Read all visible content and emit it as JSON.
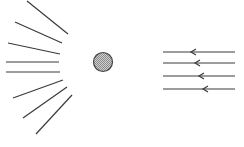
{
  "diagram": {
    "width": 244,
    "height": 147,
    "colors": {
      "line": "#3a3a3a",
      "circle_stroke": "#444444",
      "circle_fill": "#b8b8b8",
      "background": "#ffffff"
    },
    "object": {
      "shape": "circle",
      "cx": 103,
      "cy": 62,
      "r": 9.5,
      "fill_pattern": "stippled-gray"
    },
    "scattered_rays": [
      {
        "x1": 27,
        "y1": 1,
        "x2": 68,
        "y2": 34
      },
      {
        "x1": 15,
        "y1": 22,
        "x2": 62,
        "y2": 43
      },
      {
        "x1": 8,
        "y1": 43,
        "x2": 60,
        "y2": 54
      },
      {
        "x1": 6,
        "y1": 62,
        "x2": 59,
        "y2": 62
      },
      {
        "x1": 6,
        "y1": 72,
        "x2": 60,
        "y2": 72
      },
      {
        "x1": 13,
        "y1": 98,
        "x2": 63,
        "y2": 80
      },
      {
        "x1": 23,
        "y1": 118,
        "x2": 67,
        "y2": 87
      },
      {
        "x1": 36,
        "y1": 134,
        "x2": 72,
        "y2": 95
      }
    ],
    "incident_rays": [
      {
        "x1": 163,
        "x2": 235,
        "y": 52,
        "arrow_x": 191,
        "direction": "left"
      },
      {
        "x1": 163,
        "x2": 235,
        "y": 63,
        "arrow_x": 195,
        "direction": "left"
      },
      {
        "x1": 163,
        "x2": 235,
        "y": 76,
        "arrow_x": 199,
        "direction": "left"
      },
      {
        "x1": 163,
        "x2": 235,
        "y": 89,
        "arrow_x": 203,
        "direction": "left"
      }
    ]
  }
}
